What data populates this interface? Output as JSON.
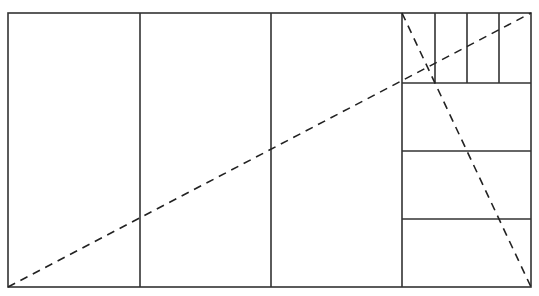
{
  "diagram": {
    "type": "rectangle subdivision",
    "stroke_color": "#333333",
    "background": "#ffffff",
    "outer_rect": {
      "x1": 8,
      "y1": 13,
      "x2": 531,
      "y2": 287
    },
    "large_columns_x": [
      140,
      271,
      402
    ],
    "right_section": {
      "x1": 402,
      "x2": 531,
      "horizontal_dividers_y": [
        83,
        151,
        219
      ],
      "top_strip_verticals_x": [
        435,
        467,
        499
      ]
    },
    "dashed_diagonals": [
      {
        "name": "main-diagonal",
        "x1": 8,
        "y1": 287,
        "x2": 531,
        "y2": 13
      },
      {
        "name": "right-section-diagonal",
        "x1": 402,
        "y1": 13,
        "x2": 531,
        "y2": 287
      }
    ]
  }
}
